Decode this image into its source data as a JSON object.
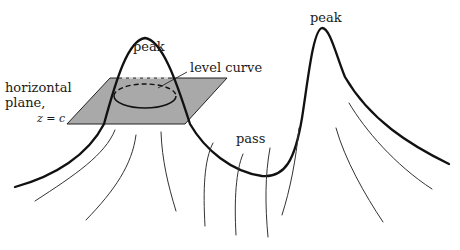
{
  "diagram": {
    "type": "terrain-level-curve-illustration",
    "labels": {
      "left_peak": "peak",
      "right_peak": "peak",
      "level_curve": "level curve",
      "plane_line1": "horizontal",
      "plane_line2": "plane,",
      "plane_equation": "z = c",
      "pass": "pass"
    },
    "colors": {
      "plane_fill": "#a9a9a9",
      "stroke": "#111111",
      "background": "#ffffff"
    },
    "elements": [
      {
        "name": "horizontal-plane",
        "kind": "parallelogram"
      },
      {
        "name": "level-curve",
        "kind": "ellipse",
        "back_half": "dashed"
      },
      {
        "name": "ridge-profile",
        "kind": "curve",
        "features": [
          "peak",
          "pass",
          "peak"
        ]
      },
      {
        "name": "slope-lines",
        "kind": "thin curves",
        "count": 10
      }
    ]
  }
}
